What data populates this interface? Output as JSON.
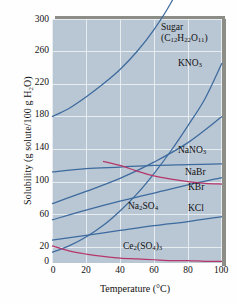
{
  "chart_data": {
    "type": "line",
    "title": "",
    "xlabel": "Temperature (°C)",
    "ylabel": "Solubility (g solute/100 g H₂O)",
    "xlim": [
      0,
      100
    ],
    "ylim": [
      0,
      300
    ],
    "xticks": [
      0,
      20,
      40,
      60,
      80,
      100
    ],
    "yticks": [
      0,
      20,
      60,
      100,
      140,
      180,
      220,
      260,
      300
    ],
    "grid": true,
    "legend_position": "inline-labels",
    "plot_background": "#b9c6d4",
    "series": [
      {
        "name": "Sugar (C12H22O11)",
        "color": "#3d6b9e",
        "x": [
          0,
          10,
          20,
          30,
          40,
          50,
          60,
          70,
          80,
          90,
          100
        ],
        "values": [
          180,
          190,
          204,
          220,
          238,
          260,
          287,
          320,
          362,
          415,
          487
        ]
      },
      {
        "name": "KNO3",
        "color": "#3d6b9e",
        "x": [
          0,
          10,
          20,
          30,
          40,
          50,
          60,
          70,
          80,
          90,
          100
        ],
        "values": [
          13,
          21,
          32,
          46,
          64,
          85,
          110,
          138,
          169,
          202,
          246
        ]
      },
      {
        "name": "NaNO3",
        "color": "#3d6b9e",
        "x": [
          0,
          20,
          40,
          60,
          80,
          100
        ],
        "values": [
          73,
          88,
          104,
          124,
          148,
          180
        ]
      },
      {
        "name": "NaBr",
        "color": "#3d6b9e",
        "x": [
          0,
          20,
          40,
          60,
          80,
          100
        ],
        "values": [
          112,
          116,
          118,
          120,
          121,
          122
        ]
      },
      {
        "name": "KBr",
        "color": "#3d6b9e",
        "x": [
          0,
          20,
          40,
          60,
          80,
          100
        ],
        "values": [
          53,
          65,
          76,
          86,
          96,
          105
        ]
      },
      {
        "name": "KCl",
        "color": "#3d6b9e",
        "x": [
          0,
          20,
          40,
          60,
          80,
          100
        ],
        "values": [
          28,
          34,
          40,
          46,
          51,
          57
        ]
      },
      {
        "name": "Na2SO4",
        "color": "#b5376a",
        "x": [
          30,
          40,
          50,
          60,
          70,
          80,
          90,
          100
        ],
        "values": [
          125,
          120,
          113,
          107,
          103,
          100,
          98,
          97
        ]
      },
      {
        "name": "Ce2(SO4)3",
        "color": "#b5376a",
        "x": [
          0,
          10,
          20,
          30,
          40,
          50,
          60,
          70,
          80,
          90,
          100
        ],
        "values": [
          21,
          15,
          11,
          8,
          6,
          5,
          4,
          3,
          3,
          2,
          2
        ]
      }
    ],
    "curve_labels": [
      {
        "id": "sugar",
        "line1": "Sugar",
        "line2": "(C",
        "sub2a": "12",
        "mid2a": "H",
        "sub2b": "22",
        "mid2b": "O",
        "sub2c": "11",
        "end2": ")"
      },
      {
        "id": "kno3",
        "text": "KNO",
        "sub": "3"
      },
      {
        "id": "nano3",
        "text": "NaNO",
        "sub": "3"
      },
      {
        "id": "nabr",
        "text": "NaBr",
        "sub": ""
      },
      {
        "id": "kbr",
        "text": "KBr",
        "sub": ""
      },
      {
        "id": "kcl",
        "text": "KCl",
        "sub": ""
      },
      {
        "id": "na2so4",
        "pre": "Na",
        "sub1": "2",
        "mid": "SO",
        "sub2": "4"
      },
      {
        "id": "ce2so43",
        "pre": "Ce",
        "sub1": "2",
        "mid": "(SO",
        "sub2": "4",
        "post": ")",
        "sub3": "3"
      }
    ]
  },
  "axes": {
    "y_title_prefix": "Solubility (g solute/100 g H",
    "y_title_sub": "2",
    "y_title_suffix": "O)",
    "x_title": "Temperature (°C)",
    "y_tick_labels": [
      "300",
      "260",
      "220",
      "180",
      "140",
      "100",
      "60",
      "20",
      "0"
    ],
    "x_tick_labels": [
      "0",
      "20",
      "40",
      "60",
      "80",
      "100"
    ]
  },
  "labels": {
    "sugar_line1": "Sugar",
    "sugar_formula_open": "(C",
    "sugar_sub1": "12",
    "sugar_mid1": "H",
    "sugar_sub2": "22",
    "sugar_mid2": "O",
    "sugar_sub3": "11",
    "sugar_close": ")",
    "kno3_text": "KNO",
    "kno3_sub": "3",
    "nano3_text": "NaNO",
    "nano3_sub": "3",
    "nabr_text": "NaBr",
    "kbr_text": "KBr",
    "kcl_text": "KCl",
    "na2so4_pre": "Na",
    "na2so4_sub1": "2",
    "na2so4_mid": "SO",
    "na2so4_sub2": "4",
    "ce_pre": "Ce",
    "ce_sub1": "2",
    "ce_mid": "(SO",
    "ce_sub2": "4",
    "ce_post": ")",
    "ce_sub3": "3"
  }
}
